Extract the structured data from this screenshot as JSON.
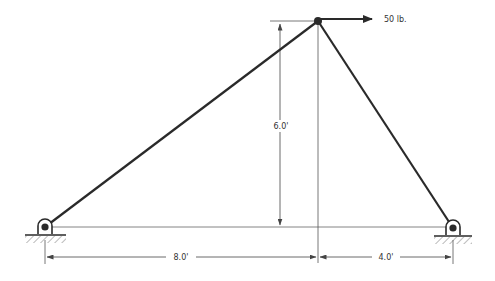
{
  "diagram": {
    "type": "truss",
    "colors": {
      "member": "#2a2a2a",
      "thin": "#555555",
      "background": "#ffffff"
    },
    "load": {
      "label": "50 lb.",
      "direction": "right"
    },
    "dimensions": {
      "height": "6.0'",
      "left_span": "8.0'",
      "right_span": "4.0'"
    },
    "supports": [
      {
        "name": "left-pin",
        "type": "pin"
      },
      {
        "name": "right-pin",
        "type": "pin"
      }
    ]
  }
}
